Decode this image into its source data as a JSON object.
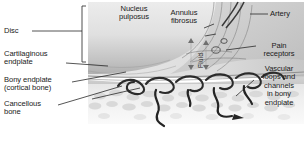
{
  "figure": {
    "background_color": "#ffffff",
    "ink_color": "#1a1a1a",
    "vessel_color": "#2e2e2e"
  },
  "labels": {
    "disc": "Disc",
    "cartilaginous_endplate": "Cartilaginous\nendplate",
    "bony_endplate": "Bony endplate\n(cortical bone)",
    "cancellous_bone": "Cancellous\nbone",
    "nucleus_pulposus": "Nucleus\npulposus",
    "annulus_fibrosus": "Annulus\nfibrosus",
    "artery": "Artery",
    "pain_receptors": "Pain\nreceptors",
    "vascular_loops": "Vascular\nloops and\nchannels\nin bony\nendplate",
    "fluid": "Fluid"
  },
  "structures": {
    "nucleus_fill_light": "#e8e8e8",
    "nucleus_fill_dark": "#b9b9b9",
    "annulus_fill": "#d6d6d6",
    "cortical_fill": "#cfcfcf",
    "cancellous_fill": "#ededed",
    "trabecula_fill": "#d2d2d2",
    "bracket_color": "#3a3a3a",
    "leader_color": "#2a2a2a"
  }
}
